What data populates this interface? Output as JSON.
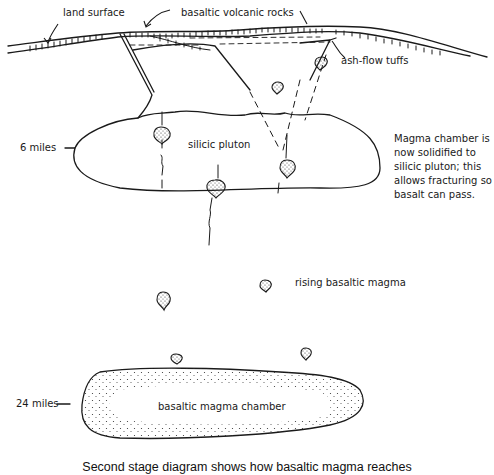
{
  "labels": {
    "land_surface": "land surface",
    "basaltic_volcanic_rocks": "basaltic volcanic rocks",
    "ash_flow_tuffs": "ash-flow tuffs",
    "silicic_pluton": "silicic pluton",
    "six_miles": "6 miles",
    "rising_basaltic_magma": "rising basaltic magma",
    "twenty_four_miles": "24 miles",
    "basaltic_magma_chamber": "basaltic magma chamber"
  },
  "note": "Magma chamber is\nnow solidified to\nsilicic pluton; this\nallows fracturing so\nbasalt can pass.",
  "caption": "Second stage diagram shows how basaltic magma reaches",
  "colors": {
    "ink": "#1a1a1a",
    "background": "#ffffff"
  }
}
